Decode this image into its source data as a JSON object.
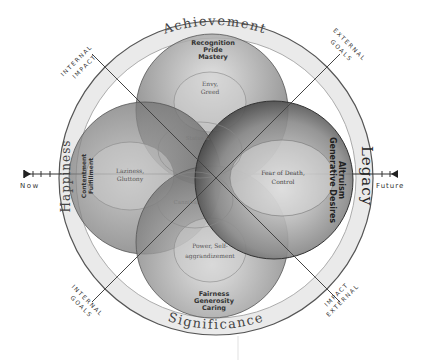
{
  "axis": {
    "left_label": "Now",
    "right_label": "Future"
  },
  "outer_ring": {
    "top": "Achievement",
    "left": "Happiness",
    "right": "Legacy",
    "bottom": "Significance"
  },
  "diagonals": {
    "top_left": [
      "INTERNAL",
      "IMPACT"
    ],
    "top_right": [
      "EXTERNAL",
      "GOALS"
    ],
    "bottom_left": [
      "INTERNAL",
      "GOALS"
    ],
    "bottom_right": [
      "EXTERNAL",
      "IMPACT"
    ]
  },
  "circles": {
    "top": {
      "virtues": [
        "Recognition",
        "Pride",
        "Mastery"
      ],
      "vice": [
        "Envy,",
        "Greed"
      ]
    },
    "left": {
      "virtues": [
        "Contentment",
        "Fulfillment"
      ],
      "vice": [
        "Laziness,",
        "Gluttony"
      ]
    },
    "right": {
      "virtues": [
        "Altruism",
        "Generative Desires"
      ],
      "vice": [
        "Fear of Death,",
        "Control"
      ]
    },
    "bottom": {
      "virtues": [
        "Fairness",
        "Generosity",
        "Caring"
      ],
      "vice": [
        "Power, Self-",
        "aggrandizement"
      ]
    }
  },
  "center_faint_labels": [
    "Status &",
    "Cannibal"
  ],
  "colors": {
    "ring_fill": "#e6e6e6",
    "ring_stroke": "#555555",
    "circle_dark": "#6a6a6a",
    "circle_light": "#d8d8d8",
    "text_dark": "#333333",
    "text_vice": "#555555"
  }
}
